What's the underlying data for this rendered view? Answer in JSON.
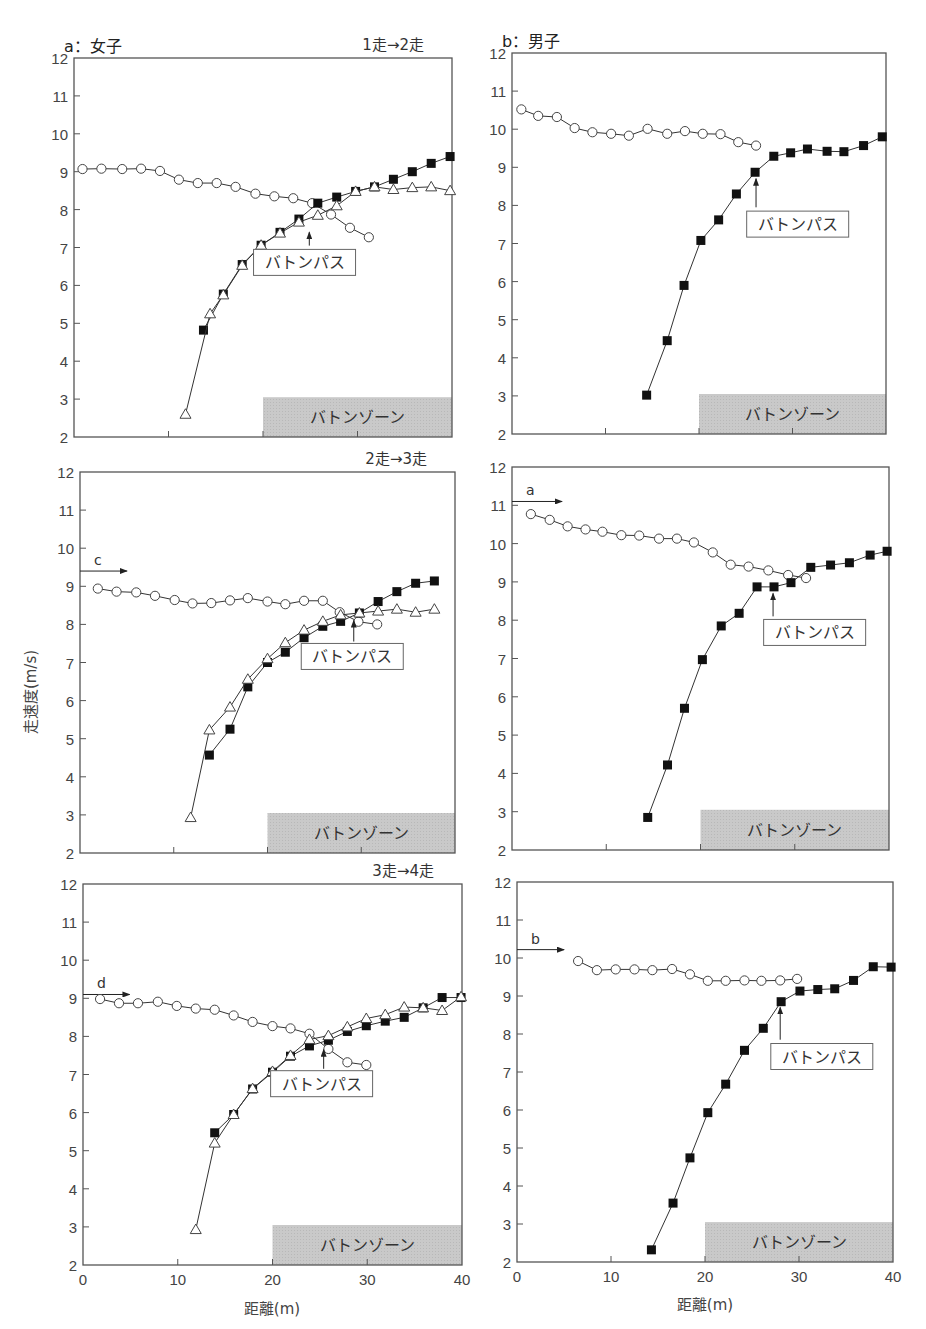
{
  "figure": {
    "y_axis_label": "走速度(m/s)",
    "x_axis_label": "距離(m)",
    "zone_label": "バトンゾーン",
    "pass_label": "バトンパス",
    "colors": {
      "axis": "#555555",
      "line": "#333333",
      "zone_fill": "#c8c8c8",
      "marker_fill_dark": "#111111",
      "marker_fill_open": "#ffffff"
    }
  },
  "chart_data": [
    {
      "id": "a1",
      "type": "line",
      "group_title": "a：女子",
      "transfer": "1走→2走",
      "xlabel": "",
      "ylabel": "",
      "xlim": [
        0,
        40
      ],
      "ylim": [
        2,
        12
      ],
      "yticks": [
        2,
        3,
        4,
        5,
        6,
        7,
        8,
        9,
        10,
        11,
        12
      ],
      "xticks": [
        0,
        10,
        20,
        30,
        40
      ],
      "show_xtick_labels": false,
      "box": [
        74,
        58,
        452,
        437
      ],
      "zone": {
        "x": [
          20,
          40
        ],
        "y": [
          2,
          3.05
        ]
      },
      "pass": {
        "x": 24.9,
        "arrow_from": 7.05,
        "arrow_to": 7.4,
        "box_x": 19,
        "box_y": 6.95
      },
      "ref": null,
      "series": [
        {
          "name": "前走者",
          "marker": "circle",
          "x": [
            0.9,
            2.9,
            5.1,
            7.1,
            9.1,
            11.1,
            13.1,
            15.1,
            17.1,
            19.2,
            21.2,
            23.2,
            25.2,
            27.2,
            29.2,
            31.2
          ],
          "y": [
            9.07,
            9.08,
            9.07,
            9.08,
            9.02,
            8.79,
            8.7,
            8.7,
            8.6,
            8.42,
            8.35,
            8.3,
            8.17,
            7.87,
            7.52,
            7.27
          ]
        },
        {
          "name": "次走者(標記A)",
          "marker": "square",
          "x": [
            13.7,
            15.8,
            17.8,
            19.8,
            21.8,
            23.8,
            25.8,
            27.8,
            29.8,
            31.8,
            33.8,
            35.8,
            37.8,
            39.8
          ],
          "y": [
            4.82,
            5.77,
            6.55,
            7.06,
            7.4,
            7.75,
            8.17,
            8.33,
            8.48,
            8.6,
            8.8,
            9.0,
            9.22,
            9.4
          ]
        },
        {
          "name": "次走者(標記B)",
          "marker": "triangle",
          "x": [
            11.8,
            14.4,
            15.8,
            17.8,
            19.8,
            21.8,
            23.8,
            25.8,
            27.8,
            29.8,
            31.8,
            33.8,
            35.8,
            37.8,
            39.8
          ],
          "y": [
            2.6,
            5.25,
            5.75,
            6.53,
            7.06,
            7.38,
            7.67,
            7.85,
            8.1,
            8.48,
            8.6,
            8.53,
            8.58,
            8.6,
            8.5
          ]
        }
      ]
    },
    {
      "id": "b1",
      "type": "line",
      "group_title": "b：男子",
      "transfer": "",
      "xlabel": "",
      "ylabel": "",
      "xlim": [
        0,
        40
      ],
      "ylim": [
        2,
        12
      ],
      "yticks": [
        2,
        3,
        4,
        5,
        6,
        7,
        8,
        9,
        10,
        11,
        12
      ],
      "xticks": [
        0,
        10,
        20,
        30,
        40
      ],
      "show_xtick_labels": false,
      "box": [
        512,
        53,
        886,
        434
      ],
      "zone": {
        "x": [
          20,
          40
        ],
        "y": [
          2,
          3.05
        ]
      },
      "pass": {
        "x": 26.1,
        "arrow_from": 7.95,
        "arrow_to": 8.7,
        "box_x": 25.1,
        "box_y": 7.85
      },
      "ref": null,
      "series": [
        {
          "name": "前走者",
          "marker": "circle",
          "x": [
            1.0,
            2.8,
            4.8,
            6.7,
            8.6,
            10.6,
            12.5,
            14.5,
            16.6,
            18.5,
            20.4,
            22.3,
            24.2,
            26.1
          ],
          "y": [
            10.52,
            10.35,
            10.32,
            10.03,
            9.92,
            9.88,
            9.83,
            10.01,
            9.88,
            9.95,
            9.88,
            9.87,
            9.66,
            9.57
          ]
        },
        {
          "name": "次走者",
          "marker": "square",
          "x": [
            14.4,
            16.6,
            18.4,
            20.2,
            22.1,
            24.0,
            26.0,
            28.0,
            29.8,
            31.6,
            33.7,
            35.5,
            37.6,
            39.6
          ],
          "y": [
            3.02,
            4.45,
            5.9,
            7.08,
            7.62,
            8.3,
            8.87,
            9.29,
            9.38,
            9.48,
            9.42,
            9.41,
            9.57,
            9.8
          ]
        }
      ]
    },
    {
      "id": "a2",
      "type": "line",
      "group_title": "",
      "transfer": "2走→3走",
      "xlabel": "",
      "ylabel": "走速度(m/s)",
      "xlim": [
        0,
        40
      ],
      "ylim": [
        2,
        12
      ],
      "yticks": [
        2,
        3,
        4,
        5,
        6,
        7,
        8,
        9,
        10,
        11,
        12
      ],
      "xticks": [
        0,
        10,
        20,
        30,
        40
      ],
      "show_xtick_labels": false,
      "box": [
        80,
        472,
        455,
        853
      ],
      "zone": {
        "x": [
          20,
          40
        ],
        "y": [
          2,
          3.05
        ]
      },
      "pass": {
        "x": 29.2,
        "arrow_from": 7.55,
        "arrow_to": 8.1,
        "box_x": 23.6,
        "box_y": 7.5
      },
      "ref": {
        "label": "c",
        "y": 9.4,
        "x_end": 5
      },
      "series": [
        {
          "name": "前走者",
          "marker": "circle",
          "x": [
            1.9,
            3.9,
            6.0,
            8.0,
            10.1,
            12.0,
            14.0,
            16.0,
            17.9,
            20.0,
            21.9,
            23.9,
            25.9,
            27.7,
            29.7,
            31.7
          ],
          "y": [
            8.94,
            8.86,
            8.84,
            8.75,
            8.64,
            8.55,
            8.56,
            8.63,
            8.69,
            8.6,
            8.53,
            8.62,
            8.62,
            8.32,
            8.07,
            8.0
          ]
        },
        {
          "name": "次走者(標記A)",
          "marker": "square",
          "x": [
            13.8,
            16.0,
            17.9,
            20.0,
            21.9,
            23.9,
            25.9,
            27.8,
            29.8,
            31.8,
            33.8,
            35.8,
            37.8
          ],
          "y": [
            4.57,
            5.25,
            6.36,
            7.0,
            7.27,
            7.65,
            7.95,
            8.08,
            8.3,
            8.6,
            8.86,
            9.08,
            9.14
          ]
        },
        {
          "name": "次走者(標記B)",
          "marker": "triangle",
          "x": [
            11.8,
            13.8,
            16.0,
            17.9,
            20.0,
            21.9,
            23.9,
            25.9,
            27.8,
            29.8,
            31.8,
            33.8,
            35.8,
            37.8
          ],
          "y": [
            2.93,
            5.23,
            5.83,
            6.56,
            7.1,
            7.52,
            7.85,
            8.08,
            8.25,
            8.3,
            8.35,
            8.4,
            8.32,
            8.4
          ]
        }
      ]
    },
    {
      "id": "b2",
      "type": "line",
      "group_title": "",
      "transfer": "",
      "xlabel": "",
      "ylabel": "",
      "xlim": [
        0,
        40
      ],
      "ylim": [
        2,
        12
      ],
      "yticks": [
        2,
        3,
        4,
        5,
        6,
        7,
        8,
        9,
        10,
        11,
        12
      ],
      "xticks": [
        0,
        10,
        20,
        30,
        40
      ],
      "show_xtick_labels": false,
      "box": [
        512,
        467,
        889,
        850
      ],
      "zone": {
        "x": [
          20,
          40
        ],
        "y": [
          2,
          3.05
        ]
      },
      "pass": {
        "x": 27.7,
        "arrow_from": 8.1,
        "arrow_to": 8.7,
        "box_x": 26.7,
        "box_y": 8.02
      },
      "ref": {
        "label": "a",
        "y": 11.1,
        "x_end": 5.3
      },
      "series": [
        {
          "name": "前走者",
          "marker": "circle",
          "x": [
            2.0,
            4.0,
            5.9,
            7.8,
            9.6,
            11.6,
            13.5,
            15.6,
            17.5,
            19.3,
            21.3,
            23.2,
            25.1,
            27.2,
            29.3,
            31.2
          ],
          "y": [
            10.77,
            10.62,
            10.45,
            10.37,
            10.31,
            10.22,
            10.21,
            10.13,
            10.13,
            10.03,
            9.77,
            9.45,
            9.4,
            9.3,
            9.18,
            9.1
          ]
        },
        {
          "name": "次走者",
          "marker": "square",
          "x": [
            14.4,
            16.5,
            18.3,
            20.2,
            22.2,
            24.1,
            26.0,
            27.8,
            29.6,
            31.7,
            33.8,
            35.8,
            38.0,
            39.8
          ],
          "y": [
            2.85,
            4.22,
            5.7,
            6.97,
            7.85,
            8.18,
            8.87,
            8.87,
            8.98,
            9.38,
            9.44,
            9.5,
            9.7,
            9.8
          ]
        }
      ]
    },
    {
      "id": "a3",
      "type": "line",
      "group_title": "",
      "transfer": "3走→4走",
      "xlabel": "距離(m)",
      "ylabel": "",
      "xlim": [
        0,
        40
      ],
      "ylim": [
        2,
        12
      ],
      "yticks": [
        2,
        3,
        4,
        5,
        6,
        7,
        8,
        9,
        10,
        11,
        12
      ],
      "xticks": [
        0,
        10,
        20,
        30,
        40
      ],
      "show_xtick_labels": true,
      "box": [
        83,
        884,
        462,
        1265
      ],
      "zone": {
        "x": [
          20,
          40
        ],
        "y": [
          2,
          3.05
        ]
      },
      "pass": {
        "x": 25.4,
        "arrow_from": 7.15,
        "arrow_to": 7.65,
        "box_x": 19.8,
        "box_y": 7.1
      },
      "ref": {
        "label": "d",
        "y": 9.1,
        "x_end": 4.9
      },
      "series": [
        {
          "name": "前走者",
          "marker": "circle",
          "x": [
            1.8,
            3.8,
            5.8,
            7.9,
            9.9,
            11.9,
            13.9,
            15.9,
            17.9,
            20.0,
            21.9,
            23.9,
            25.9,
            27.9,
            29.9
          ],
          "y": [
            8.98,
            8.87,
            8.87,
            8.91,
            8.8,
            8.73,
            8.7,
            8.55,
            8.38,
            8.27,
            8.21,
            8.07,
            7.67,
            7.32,
            7.25
          ]
        },
        {
          "name": "次走者(標記A)",
          "marker": "square",
          "x": [
            13.9,
            15.9,
            17.9,
            20.0,
            21.9,
            23.9,
            25.9,
            27.9,
            29.9,
            31.9,
            33.9,
            35.9,
            37.9,
            39.9
          ],
          "y": [
            5.47,
            5.95,
            6.62,
            7.06,
            7.48,
            7.75,
            7.9,
            8.13,
            8.28,
            8.4,
            8.5,
            8.75,
            9.02,
            9.02
          ]
        },
        {
          "name": "次走者(標記B)",
          "marker": "triangle",
          "x": [
            11.9,
            13.9,
            15.9,
            17.9,
            20.0,
            21.9,
            23.9,
            25.9,
            27.9,
            29.9,
            31.9,
            33.9,
            35.9,
            37.9,
            39.9
          ],
          "y": [
            2.93,
            5.2,
            5.95,
            6.63,
            7.08,
            7.5,
            7.92,
            8.02,
            8.25,
            8.47,
            8.57,
            8.77,
            8.75,
            8.68,
            9.04
          ]
        }
      ]
    },
    {
      "id": "b3",
      "type": "line",
      "group_title": "",
      "transfer": "",
      "xlabel": "距離(m)",
      "ylabel": "",
      "xlim": [
        0,
        40
      ],
      "ylim": [
        2,
        12
      ],
      "yticks": [
        2,
        3,
        4,
        5,
        6,
        7,
        8,
        9,
        10,
        11,
        12
      ],
      "xticks": [
        0,
        10,
        20,
        30,
        40
      ],
      "show_xtick_labels": true,
      "box": [
        517,
        882,
        893,
        1262
      ],
      "zone": {
        "x": [
          20,
          40
        ],
        "y": [
          2,
          3.05
        ]
      },
      "pass": {
        "x": 28.0,
        "arrow_from": 7.85,
        "arrow_to": 8.7,
        "box_x": 27.0,
        "box_y": 7.75
      },
      "ref": {
        "label": "b",
        "y": 10.22,
        "x_end": 5.0
      },
      "series": [
        {
          "name": "前走者",
          "marker": "circle",
          "x": [
            6.5,
            8.5,
            10.5,
            12.5,
            14.4,
            16.5,
            18.4,
            20.3,
            22.2,
            24.2,
            26.0,
            28.0,
            29.8
          ],
          "y": [
            9.92,
            9.68,
            9.7,
            9.7,
            9.68,
            9.71,
            9.57,
            9.4,
            9.4,
            9.41,
            9.4,
            9.41,
            9.45
          ]
        },
        {
          "name": "次走者",
          "marker": "square",
          "x": [
            14.3,
            16.6,
            18.4,
            20.3,
            22.2,
            24.2,
            26.2,
            28.1,
            30.1,
            32.0,
            33.8,
            35.8,
            37.9,
            39.8
          ],
          "y": [
            2.32,
            3.55,
            4.74,
            5.93,
            6.68,
            7.57,
            8.15,
            8.85,
            9.13,
            9.17,
            9.19,
            9.41,
            9.77,
            9.76
          ]
        }
      ]
    }
  ]
}
